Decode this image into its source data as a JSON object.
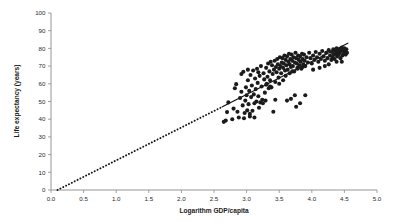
{
  "chart_data": {
    "type": "scatter",
    "title": "",
    "xlabel": "Logarithm GDP/capita",
    "ylabel": "Life expectancy (years)",
    "xlim": [
      0.0,
      5.0
    ],
    "ylim": [
      0,
      100
    ],
    "xticks": [
      "0.0",
      "0.5",
      "1.0",
      "1.5",
      "2.0",
      "2.5",
      "3.0",
      "3.5",
      "4.0",
      "4.5",
      "5.0"
    ],
    "xtick_values": [
      0.0,
      0.5,
      1.0,
      1.5,
      2.0,
      2.5,
      3.0,
      3.5,
      4.0,
      4.5,
      5.0
    ],
    "yticks": [
      "0",
      "10",
      "20",
      "30",
      "40",
      "50",
      "60",
      "70",
      "80",
      "90",
      "100"
    ],
    "ytick_values": [
      0,
      10,
      20,
      30,
      40,
      50,
      60,
      70,
      80,
      90,
      100
    ],
    "grid": false,
    "legend": null,
    "marker_color": "#1b1b1b",
    "line_color": "#111111",
    "axis_color": "#8a8a8a",
    "series": [
      {
        "name": "Countries",
        "type": "scatter",
        "points": [
          [
            2.65,
            38.5
          ],
          [
            2.68,
            39.2
          ],
          [
            2.7,
            44.0
          ],
          [
            2.72,
            49.5
          ],
          [
            2.78,
            40.0
          ],
          [
            2.8,
            46.0
          ],
          [
            2.82,
            57.5
          ],
          [
            2.84,
            59.8
          ],
          [
            2.86,
            44.2
          ],
          [
            2.88,
            41.0
          ],
          [
            2.9,
            52.0
          ],
          [
            2.92,
            55.5
          ],
          [
            2.94,
            47.8
          ],
          [
            2.95,
            66.8
          ],
          [
            2.97,
            43.5
          ],
          [
            2.98,
            50.5
          ],
          [
            2.99,
            58.0
          ],
          [
            3.0,
            53.5
          ],
          [
            3.01,
            45.0
          ],
          [
            3.02,
            62.0
          ],
          [
            3.03,
            48.5
          ],
          [
            3.04,
            56.0
          ],
          [
            3.05,
            41.5
          ],
          [
            3.06,
            65.0
          ],
          [
            3.07,
            52.5
          ],
          [
            3.08,
            59.0
          ],
          [
            3.09,
            44.8
          ],
          [
            3.1,
            67.5
          ],
          [
            3.11,
            54.0
          ],
          [
            3.12,
            49.0
          ],
          [
            3.13,
            63.0
          ],
          [
            3.14,
            57.0
          ],
          [
            3.15,
            50.0
          ],
          [
            3.16,
            68.5
          ],
          [
            3.17,
            60.5
          ],
          [
            3.18,
            53.0
          ],
          [
            3.19,
            46.5
          ],
          [
            3.2,
            64.5
          ],
          [
            3.21,
            49.5
          ],
          [
            3.22,
            70.0
          ],
          [
            3.23,
            58.5
          ],
          [
            3.24,
            51.0
          ],
          [
            3.25,
            49.0
          ],
          [
            3.26,
            66.0
          ],
          [
            3.27,
            62.5
          ],
          [
            3.28,
            55.0
          ],
          [
            3.29,
            50.5
          ],
          [
            3.3,
            69.0
          ],
          [
            3.31,
            60.0
          ],
          [
            3.32,
            64.0
          ],
          [
            3.33,
            71.5
          ],
          [
            3.34,
            57.5
          ],
          [
            3.35,
            67.0
          ],
          [
            3.36,
            62.0
          ],
          [
            3.37,
            72.5
          ],
          [
            3.38,
            58.0
          ],
          [
            3.39,
            70.5
          ],
          [
            3.4,
            65.5
          ],
          [
            3.41,
            44.2
          ],
          [
            3.42,
            68.0
          ],
          [
            3.43,
            73.0
          ],
          [
            3.44,
            61.0
          ],
          [
            3.45,
            69.5
          ],
          [
            3.46,
            66.5
          ],
          [
            3.47,
            74.0
          ],
          [
            3.48,
            71.0
          ],
          [
            3.49,
            63.5
          ],
          [
            3.5,
            68.5
          ],
          [
            3.51,
            75.0
          ],
          [
            3.52,
            70.0
          ],
          [
            3.53,
            66.0
          ],
          [
            3.54,
            72.0
          ],
          [
            3.55,
            74.5
          ],
          [
            3.56,
            69.0
          ],
          [
            3.57,
            71.5
          ],
          [
            3.58,
            76.0
          ],
          [
            3.59,
            67.5
          ],
          [
            3.6,
            73.5
          ],
          [
            3.61,
            70.5
          ],
          [
            3.62,
            75.5
          ],
          [
            3.63,
            68.0
          ],
          [
            3.64,
            72.5
          ],
          [
            3.65,
            77.0
          ],
          [
            3.66,
            71.0
          ],
          [
            3.67,
            74.0
          ],
          [
            3.68,
            69.5
          ],
          [
            3.69,
            76.5
          ],
          [
            3.7,
            73.0
          ],
          [
            3.71,
            70.0
          ],
          [
            3.72,
            75.0
          ],
          [
            3.73,
            67.0
          ],
          [
            3.74,
            72.0
          ],
          [
            3.75,
            77.5
          ],
          [
            3.76,
            74.5
          ],
          [
            3.77,
            71.5
          ],
          [
            3.78,
            69.0
          ],
          [
            3.79,
            76.0
          ],
          [
            3.8,
            73.5
          ],
          [
            3.81,
            70.5
          ],
          [
            3.82,
            75.5
          ],
          [
            3.83,
            72.5
          ],
          [
            3.84,
            68.5
          ],
          [
            3.85,
            77.0
          ],
          [
            3.86,
            74.0
          ],
          [
            3.87,
            71.0
          ],
          [
            3.88,
            76.5
          ],
          [
            3.89,
            73.0
          ],
          [
            3.9,
            70.0
          ],
          [
            3.92,
            75.0
          ],
          [
            3.94,
            72.0
          ],
          [
            3.96,
            77.5
          ],
          [
            3.98,
            74.5
          ],
          [
            4.0,
            71.5
          ],
          [
            4.02,
            76.0
          ],
          [
            4.04,
            73.5
          ],
          [
            4.06,
            78.0
          ],
          [
            4.08,
            75.0
          ],
          [
            4.1,
            72.5
          ],
          [
            4.12,
            77.0
          ],
          [
            4.14,
            74.0
          ],
          [
            4.16,
            78.5
          ],
          [
            4.18,
            75.5
          ],
          [
            4.2,
            73.0
          ],
          [
            4.22,
            77.5
          ],
          [
            4.24,
            74.5
          ],
          [
            4.26,
            79.0
          ],
          [
            4.28,
            76.0
          ],
          [
            4.3,
            73.5
          ],
          [
            4.31,
            78.0
          ],
          [
            4.32,
            75.0
          ],
          [
            4.33,
            79.5
          ],
          [
            4.34,
            76.5
          ],
          [
            4.35,
            74.0
          ],
          [
            4.36,
            78.5
          ],
          [
            4.37,
            77.0
          ],
          [
            4.38,
            80.0
          ],
          [
            4.39,
            75.5
          ],
          [
            4.4,
            78.0
          ],
          [
            4.41,
            76.5
          ],
          [
            4.42,
            79.5
          ],
          [
            4.43,
            77.5
          ],
          [
            4.44,
            74.5
          ],
          [
            4.45,
            78.5
          ],
          [
            4.46,
            80.5
          ],
          [
            4.47,
            76.0
          ],
          [
            4.48,
            79.0
          ],
          [
            4.49,
            77.0
          ],
          [
            4.5,
            80.0
          ],
          [
            4.51,
            78.0
          ],
          [
            4.52,
            76.5
          ],
          [
            4.53,
            79.5
          ],
          [
            4.54,
            77.5
          ],
          [
            4.46,
            72.5
          ],
          [
            4.2,
            70.0
          ],
          [
            3.44,
            51.0
          ],
          [
            3.62,
            50.5
          ],
          [
            3.68,
            51.5
          ],
          [
            3.74,
            53.5
          ],
          [
            3.76,
            47.0
          ],
          [
            3.82,
            49.0
          ],
          [
            3.9,
            53.5
          ],
          [
            2.96,
            40.5
          ],
          [
            3.12,
            41.0
          ],
          [
            3.05,
            43.0
          ],
          [
            2.92,
            65.5
          ],
          [
            3.02,
            68.0
          ],
          [
            3.18,
            66.5
          ],
          [
            3.3,
            59.5
          ],
          [
            3.36,
            58.5
          ],
          [
            3.5,
            60.0
          ],
          [
            3.56,
            62.0
          ],
          [
            3.6,
            64.5
          ],
          [
            3.66,
            66.0
          ],
          [
            3.7,
            67.0
          ],
          [
            3.78,
            68.5
          ],
          [
            3.86,
            69.5
          ],
          [
            4.02,
            68.0
          ],
          [
            4.12,
            69.0
          ],
          [
            4.26,
            71.0
          ],
          [
            4.38,
            72.5
          ]
        ]
      },
      {
        "name": "Fitted regression line",
        "type": "line",
        "style": "dotted-extrapolated-then-solid",
        "x_start": 0.1,
        "y_start": 0.0,
        "x_solid_start": 2.62,
        "x_end": 4.56,
        "y_end": 83.0,
        "slope": 18.6,
        "intercept": -1.86
      }
    ],
    "annotations": []
  },
  "axes": {
    "x_title": "Logarithm GDP/capita",
    "y_title": "Life expectancy (years)"
  }
}
